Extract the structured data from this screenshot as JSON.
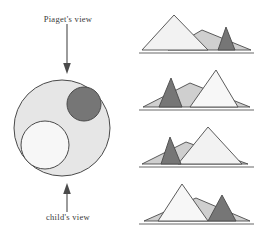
{
  "figure": {
    "title_top": "Piaget's view",
    "title_bottom": "child's view",
    "arrows": [
      {
        "name": "arrow-down-piaget",
        "direction": "down"
      },
      {
        "name": "arrow-up-child",
        "direction": "up"
      }
    ]
  },
  "colors": {
    "background": "#ffffff",
    "outline": "#4a4a4a",
    "light_gray": "#e6e6e6",
    "very_light": "#f7f7f7",
    "medium_gray": "#cfcfcf",
    "dark_gray": "#767676",
    "ground": "#9a9a9a",
    "text": "#3a3a3a"
  },
  "circle_diagram": {
    "name": "three-mountains-plan-view",
    "outer_circle": {
      "cx": 62,
      "cy": 128,
      "r": 48,
      "fill": "#e6e6e6"
    },
    "dark_circle": {
      "cx": 84,
      "cy": 104,
      "r": 17,
      "fill": "#767676",
      "label": "dark-mountain"
    },
    "light_circle": {
      "cx": 45,
      "cy": 145,
      "r": 24,
      "fill": "#f7f7f7",
      "label": "light-mountain"
    }
  },
  "chart_data": {
    "type": "diagram",
    "legend": [
      {
        "name": "light-peak",
        "color": "#f2f2f2",
        "label": "light mountain"
      },
      {
        "name": "medium-peak",
        "color": "#cfcfcf",
        "label": "medium mountain"
      },
      {
        "name": "dark-peak",
        "color": "#767676",
        "label": "dark mountain"
      }
    ],
    "panels": [
      {
        "index": 1,
        "name": "viewpoint-panel-1",
        "peaks": [
          {
            "id": "light",
            "color": "#f2f2f2",
            "apex_x": 36,
            "apex_y": 7,
            "base_left": 4,
            "base_right": 70,
            "z": 3
          },
          {
            "id": "medium",
            "color": "#cfcfcf",
            "apex_x": 64,
            "apex_y": 22,
            "base_left": 30,
            "base_right": 113,
            "z": 2
          },
          {
            "id": "dark",
            "color": "#767676",
            "apex_x": 88,
            "apex_y": 19,
            "base_left": 80,
            "base_right": 97,
            "z": 4
          }
        ]
      },
      {
        "index": 2,
        "name": "viewpoint-panel-2",
        "peaks": [
          {
            "id": "medium",
            "color": "#cfcfcf",
            "apex_x": 52,
            "apex_y": 18,
            "base_left": 5,
            "base_right": 112,
            "z": 2
          },
          {
            "id": "dark",
            "color": "#767676",
            "apex_x": 33,
            "apex_y": 13,
            "base_left": 21,
            "base_right": 44,
            "z": 4
          },
          {
            "id": "light",
            "color": "#f7f7f7",
            "apex_x": 78,
            "apex_y": 5,
            "base_left": 52,
            "base_right": 100,
            "z": 3
          }
        ]
      },
      {
        "index": 3,
        "name": "viewpoint-panel-3",
        "peaks": [
          {
            "id": "medium",
            "color": "#cfcfcf",
            "apex_x": 48,
            "apex_y": 20,
            "base_left": 4,
            "base_right": 110,
            "z": 2
          },
          {
            "id": "dark",
            "color": "#767676",
            "apex_x": 32,
            "apex_y": 15,
            "base_left": 23,
            "base_right": 43,
            "z": 4
          },
          {
            "id": "light",
            "color": "#f2f2f2",
            "apex_x": 70,
            "apex_y": 5,
            "base_left": 40,
            "base_right": 104,
            "z": 3
          }
        ]
      },
      {
        "index": 4,
        "name": "viewpoint-panel-4",
        "peaks": [
          {
            "id": "medium",
            "color": "#cfcfcf",
            "apex_x": 58,
            "apex_y": 19,
            "base_left": 6,
            "base_right": 112,
            "z": 2
          },
          {
            "id": "light",
            "color": "#f7f7f7",
            "apex_x": 44,
            "apex_y": 5,
            "base_left": 20,
            "base_right": 70,
            "z": 3
          },
          {
            "id": "dark",
            "color": "#767676",
            "apex_x": 84,
            "apex_y": 16,
            "base_left": 70,
            "base_right": 98,
            "z": 4
          }
        ]
      }
    ]
  }
}
